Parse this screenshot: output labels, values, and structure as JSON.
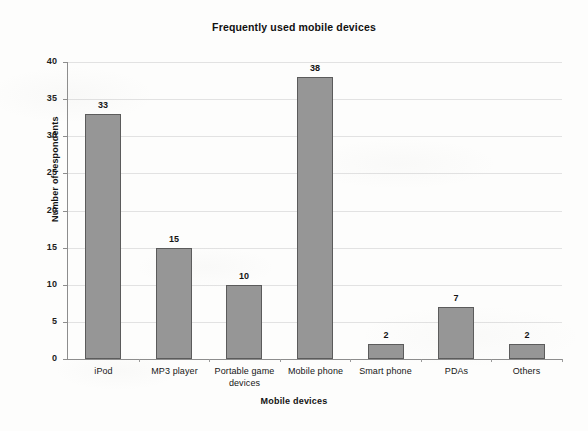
{
  "chart_data": {
    "type": "bar",
    "title": "Frequently used mobile devices",
    "xlabel": "Mobile devices",
    "ylabel": "Number of respondents",
    "categories": [
      "iPod",
      "MP3 player",
      "Portable game devices",
      "Mobile phone",
      "Smart phone",
      "PDAs",
      "Others"
    ],
    "values": [
      33,
      15,
      10,
      38,
      2,
      7,
      2
    ],
    "value_labels": [
      "33",
      "15",
      "10",
      "38",
      "2",
      "7",
      "2"
    ],
    "ylim": [
      0,
      40
    ],
    "ytick_values": [
      0,
      5,
      10,
      15,
      20,
      25,
      30,
      35,
      40
    ],
    "ytick_labels": [
      "0",
      "5",
      "10",
      "15",
      "20",
      "25",
      "30",
      "35",
      "40"
    ],
    "grid": "horizontal",
    "legend": "none",
    "bar_color": "#969696",
    "bar_border_color": "#5b5b5b",
    "gridline_color": "#e2e2e2",
    "axis_color": "#8d8d8d",
    "background_color": "#fdfdfc",
    "text_color": "#1a1a1a"
  },
  "category_label_lines": [
    [
      "iPod"
    ],
    [
      "MP3 player"
    ],
    [
      "Portable game",
      "devices"
    ],
    [
      "Mobile phone"
    ],
    [
      "Smart phone"
    ],
    [
      "PDAs"
    ],
    [
      "Others"
    ]
  ]
}
